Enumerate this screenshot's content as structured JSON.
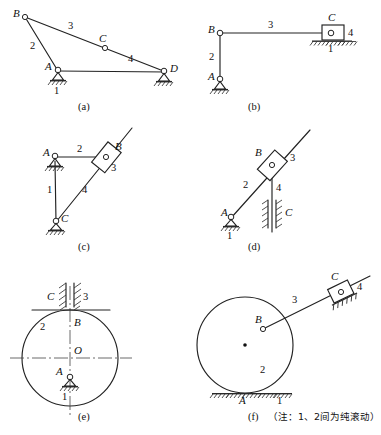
{
  "figure": {
    "background_color": "#ffffff",
    "line_color": "#222222",
    "text_color": "#111111",
    "note_text": "（注：1、2间为纯滚动）",
    "note_meaning": "Note: rolling without slipping between links 1 and 2"
  },
  "panels": [
    {
      "id": "a",
      "caption": "(a)",
      "type": "four-bar-linkage",
      "joints": [
        "A",
        "B",
        "C",
        "D"
      ],
      "links": [
        "1",
        "2",
        "3",
        "4"
      ],
      "labels": {
        "A": "A",
        "B": "B",
        "C": "C",
        "D": "D",
        "link1": "1",
        "link2": "2",
        "link3": "3",
        "link4": "4"
      }
    },
    {
      "id": "b",
      "caption": "(b)",
      "type": "slider-crank",
      "joints": [
        "A",
        "B",
        "C"
      ],
      "links": [
        "1",
        "2",
        "3",
        "4"
      ],
      "labels": {
        "A": "A",
        "B": "B",
        "C": "C",
        "link1": "1",
        "link2": "2",
        "link3": "3",
        "link4": "4"
      }
    },
    {
      "id": "c",
      "caption": "(c)",
      "type": "oscillating-block",
      "joints": [
        "A",
        "B",
        "C"
      ],
      "links": [
        "1",
        "2",
        "3",
        "4"
      ],
      "labels": {
        "A": "A",
        "B": "B",
        "C": "C",
        "link1": "1",
        "link2": "2",
        "link3": "3",
        "link4": "4"
      }
    },
    {
      "id": "d",
      "caption": "(d)",
      "type": "guided-slider",
      "joints": [
        "A",
        "B",
        "C"
      ],
      "links": [
        "1",
        "2",
        "3",
        "4"
      ],
      "labels": {
        "A": "A",
        "B": "B",
        "C": "C",
        "link1": "1",
        "link2": "2",
        "link3": "3",
        "link4": "4"
      }
    },
    {
      "id": "e",
      "caption": "(e)",
      "type": "cam-disc-with-guide",
      "joints": [
        "A",
        "B",
        "C",
        "O"
      ],
      "links": [
        "1",
        "2",
        "3"
      ],
      "labels": {
        "A": "A",
        "B": "B",
        "C": "C",
        "O": "O",
        "link1": "1",
        "link2": "2",
        "link3": "3"
      }
    },
    {
      "id": "f",
      "caption": "(f)",
      "type": "rolling-disc-linkage",
      "joints": [
        "A",
        "B",
        "C"
      ],
      "links": [
        "1",
        "2",
        "3",
        "4"
      ],
      "labels": {
        "A": "A",
        "B": "B",
        "C": "C",
        "link1": "1",
        "link2": "2",
        "link3": "3",
        "link4": "4"
      }
    }
  ]
}
